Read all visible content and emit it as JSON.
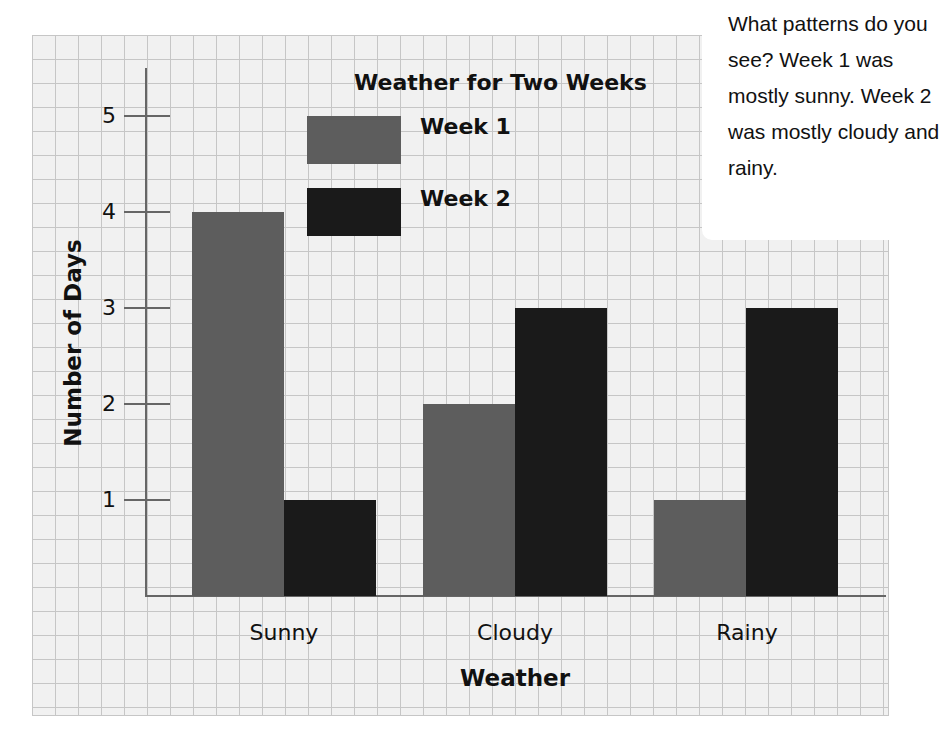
{
  "chart_data": {
    "type": "bar",
    "title": "Weather for Two Weeks",
    "xlabel": "Weather",
    "ylabel": "Number of Days",
    "categories": [
      "Sunny",
      "Cloudy",
      "Rainy"
    ],
    "series": [
      {
        "name": "Week 1",
        "values": [
          4,
          2,
          1
        ],
        "color": "#5d5d5d"
      },
      {
        "name": "Week 2",
        "values": [
          1,
          3,
          3
        ],
        "color": "#1a1a1a"
      }
    ],
    "ylim": [
      0,
      5
    ],
    "yticks": [
      "1",
      "2",
      "3",
      "4",
      "5"
    ],
    "grid": true,
    "legend_position": "top-center"
  },
  "legend": {
    "week1": "Week 1",
    "week2": "Week 2"
  },
  "callout": {
    "text": "What patterns do you see? Week 1 was mostly sunny. Week 2 was mostly cloudy and rainy."
  }
}
